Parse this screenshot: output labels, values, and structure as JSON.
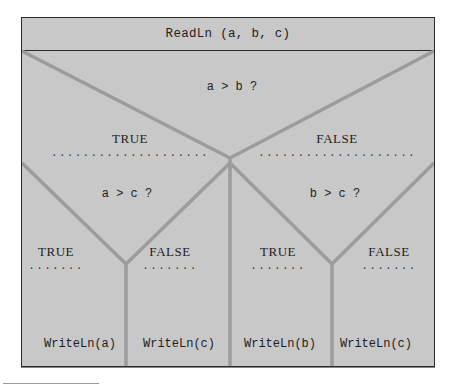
{
  "diagram": {
    "type": "Nassi-Shneiderman structogram",
    "header": "ReadLn (a, b, c)",
    "decision_main": {
      "condition": "a > b ?",
      "true_label": "TRUE",
      "false_label": "FALSE",
      "dots_long": "....................",
      "dots_short": "......."
    },
    "decision_left": {
      "condition": "a > c ?",
      "true_label": "TRUE",
      "false_label": "FALSE",
      "true_action": "WriteLn(a)",
      "false_action": "WriteLn(c)"
    },
    "decision_right": {
      "condition": "b > c ?",
      "true_label": "TRUE",
      "false_label": "FALSE",
      "true_action": "WriteLn(b)",
      "false_action": "WriteLn(c)"
    },
    "colors": {
      "background": "#c8c8c8",
      "border": "#2a2a2a",
      "branch_lines": "#9c9c9c"
    }
  }
}
